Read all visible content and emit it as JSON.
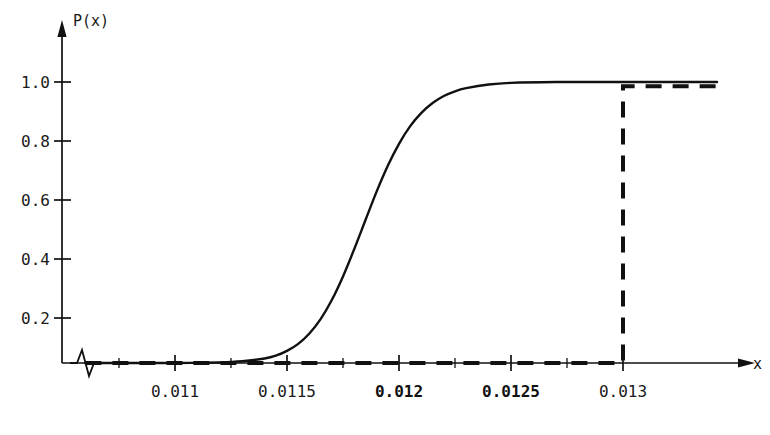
{
  "chart_data": {
    "type": "line",
    "title": "",
    "subtitle": "",
    "xlabel": "x",
    "ylabel": "P(x)",
    "xlim": [
      0.01055,
      0.01343
    ],
    "ylim": [
      0.0,
      1.08
    ],
    "grid": false,
    "legend": "none",
    "axis_break": true,
    "axis_break_note": "zigzag break on x-axis just right of origin",
    "x_ticks": [
      {
        "value": 0.011,
        "label": "0.011",
        "bold": false
      },
      {
        "value": 0.0115,
        "label": "0.0115",
        "bold": false
      },
      {
        "value": 0.012,
        "label": "0.012",
        "bold": true
      },
      {
        "value": 0.0125,
        "label": "0.0125",
        "bold": true
      },
      {
        "value": 0.013,
        "label": "0.013",
        "bold": false
      }
    ],
    "y_ticks": [
      {
        "value": 0.2,
        "label": "0.2"
      },
      {
        "value": 0.4,
        "label": "0.4"
      },
      {
        "value": 0.6,
        "label": "0.6"
      },
      {
        "value": 0.8,
        "label": "0.8"
      },
      {
        "value": 1.0,
        "label": "1.0"
      }
    ],
    "minor_x_ticks": [
      0.01075,
      0.01125,
      0.01175,
      0.01225,
      0.01275
    ],
    "series": [
      {
        "name": "smooth-cdf",
        "style": "solid",
        "color": "#111111",
        "description": "smooth sigmoid cumulative distribution rising from 0 to 1",
        "x": [
          0.0106,
          0.0108,
          0.011,
          0.0112,
          0.0113,
          0.0114,
          0.01145,
          0.0115,
          0.01155,
          0.0116,
          0.01165,
          0.0117,
          0.01175,
          0.0118,
          0.01185,
          0.0119,
          0.01195,
          0.012,
          0.01205,
          0.0121,
          0.01215,
          0.0122,
          0.01225,
          0.0123,
          0.0124,
          0.0125,
          0.0127,
          0.0129,
          0.013,
          0.0132,
          0.01342
        ],
        "y": [
          0.0,
          0.0,
          0.0,
          0.002,
          0.006,
          0.016,
          0.026,
          0.043,
          0.068,
          0.105,
          0.156,
          0.224,
          0.308,
          0.405,
          0.508,
          0.61,
          0.702,
          0.78,
          0.843,
          0.89,
          0.925,
          0.95,
          0.967,
          0.978,
          0.991,
          0.997,
          1.0,
          1.0,
          1.0,
          1.0,
          1.0
        ]
      },
      {
        "name": "empirical-step",
        "style": "dashed",
        "color": "#111111",
        "description": "dashed step function staying at 0 until x=0.013 then jumping to 0.99",
        "x": [
          0.0106,
          0.013,
          0.013,
          0.01342
        ],
        "y": [
          0.0,
          0.0,
          0.985,
          0.985
        ]
      }
    ]
  },
  "axis": {
    "y_axis_label": "P(x)",
    "x_axis_label": "x",
    "y_arrow": "arrow-up",
    "x_arrow": "arrow-right"
  }
}
